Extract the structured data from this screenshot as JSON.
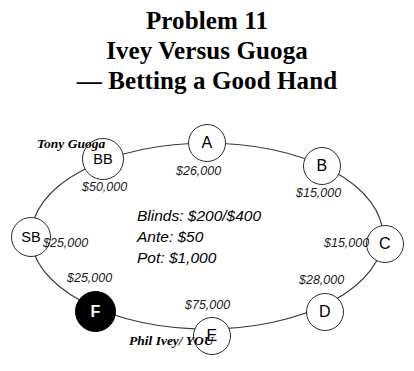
{
  "title": {
    "line1": "Problem 11",
    "line2": "Ivey Versus Guoga",
    "line3": "— Betting a Good Hand"
  },
  "table": {
    "center_info": {
      "blinds": "Blinds: $200/$400",
      "ante": "Ante: $50",
      "pot": "Pot: $1,000"
    },
    "seats": [
      {
        "id": "BB",
        "label": "BB",
        "stack": "$50,000",
        "player": null
      },
      {
        "id": "A",
        "label": "A",
        "stack": "$26,000",
        "player": null
      },
      {
        "id": "B",
        "label": "B",
        "stack": "$15,000",
        "player": null
      },
      {
        "id": "C",
        "label": "C",
        "stack": "$15,000",
        "player": null
      },
      {
        "id": "D",
        "label": "D",
        "stack": "$28,000",
        "player": null
      },
      {
        "id": "E",
        "label": "E",
        "stack": "$75,000",
        "player": "Phil Ivey/\nYOU"
      },
      {
        "id": "F",
        "label": "F",
        "stack": "$25,000",
        "player": null
      },
      {
        "id": "SB",
        "label": "SB",
        "stack": "$25,000",
        "player": null
      }
    ],
    "player_tags": {
      "guoga_line1": "Tony",
      "guoga_line2": "Guoga",
      "ivey_line1": "Phil Ivey/",
      "ivey_line2": "YOU"
    }
  },
  "colors": {
    "hero_fill": "#000000",
    "seat_stroke": "#2b2b2b",
    "text": "#000000",
    "background": "#ffffff"
  }
}
